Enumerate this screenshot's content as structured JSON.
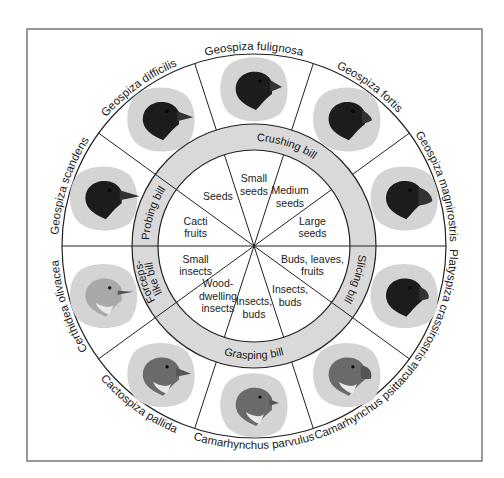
{
  "diagram": {
    "frame": {
      "x": 27,
      "y": 29,
      "width": 455,
      "height": 432
    },
    "center": {
      "x": 254,
      "y": 246
    },
    "radii": {
      "outer": 192,
      "ring_outer": 122,
      "ring_inner": 96
    },
    "colors": {
      "line": "#222222",
      "frame": "#555555",
      "ring_fill": "#d9d9d9",
      "bird_blob": "#d4d4d4",
      "inner_fill": "#ffffff"
    },
    "ring_sections": [
      {
        "label": "Crushing bill",
        "start": 0,
        "end": 144
      },
      {
        "label": "Probing bill",
        "start": 144,
        "end": 180
      },
      {
        "label": "Forceps-like bill",
        "start": 180,
        "end": 216
      },
      {
        "label": "Grasping bill",
        "start": 216,
        "end": 324
      },
      {
        "label": "Slicing bill",
        "start": 324,
        "end": 360
      }
    ],
    "species": [
      {
        "name": "Geospiza fortis",
        "angle": 54,
        "head": "dark",
        "beak": "large-conical"
      },
      {
        "name": "Geospiza fulignosa",
        "angle": 90,
        "head": "dark",
        "beak": "small-conical"
      },
      {
        "name": "Geospiza difficilis",
        "angle": 126,
        "head": "dark",
        "beak": "pointed"
      },
      {
        "name": "Geospiza scandens",
        "angle": 162,
        "head": "dark",
        "beak": "long-pointed"
      },
      {
        "name": "Certhidea olivacea",
        "angle": 198,
        "head": "light",
        "beak": "thin-probing"
      },
      {
        "name": "Cactospiza pallida",
        "angle": 234,
        "head": "medium",
        "beak": "medium-pointed"
      },
      {
        "name": "Camarhynchus parvulus",
        "angle": 270,
        "head": "medium",
        "beak": "small-grasping"
      },
      {
        "name": "Camarhynchus psittacula",
        "angle": 306,
        "head": "medium",
        "beak": "parrot-like"
      },
      {
        "name": "Platyspiza crassirostris",
        "angle": 342,
        "head": "dark",
        "beak": "thick-slicing"
      },
      {
        "name": "Geospiza magnirostris",
        "angle": 18,
        "head": "dark",
        "beak": "very-large-crushing"
      }
    ],
    "diets": [
      {
        "lines": [
          "Large",
          "seeds"
        ],
        "angle": 18
      },
      {
        "lines": [
          "Medium",
          "seeds"
        ],
        "angle": 54
      },
      {
        "lines": [
          "Small",
          "seeds"
        ],
        "angle": 90
      },
      {
        "lines": [
          "Seeds"
        ],
        "angle": 126
      },
      {
        "lines": [
          "Cacti",
          "fruits"
        ],
        "angle": 162
      },
      {
        "lines": [
          "Small",
          "insects"
        ],
        "angle": 198
      },
      {
        "lines": [
          "Wood-",
          "dwelling",
          "insects"
        ],
        "angle": 234
      },
      {
        "lines": [
          "Insects,",
          "buds"
        ],
        "angle": 270
      },
      {
        "lines": [
          "Insects,",
          "buds"
        ],
        "angle": 306
      },
      {
        "lines": [
          "Buds, leaves,",
          "fruits"
        ],
        "angle": 342
      }
    ],
    "divider_angles": [
      0,
      36,
      72,
      108,
      144,
      180,
      216,
      252,
      288,
      324
    ]
  }
}
